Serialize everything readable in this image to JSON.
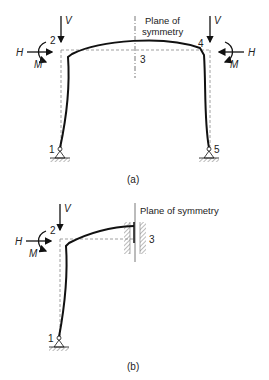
{
  "figure_a": {
    "caption": "(a)",
    "plane_label_line1": "Plane of",
    "plane_label_line2": "symmetry",
    "nodes": [
      "1",
      "2",
      "3",
      "4",
      "5"
    ],
    "left_loads": {
      "vertical": "V",
      "horizontal": "H",
      "moment": "M"
    },
    "right_loads": {
      "vertical": "V",
      "horizontal": "H",
      "moment": "M"
    }
  },
  "figure_b": {
    "caption": "(b)",
    "plane_label": "Plane of symmetry",
    "nodes": [
      "1",
      "2",
      "3"
    ],
    "loads": {
      "vertical": "V",
      "horizontal": "H",
      "moment": "M"
    }
  },
  "colors": {
    "line": "#111111",
    "dashed": "#888888",
    "hatch": "#777777"
  }
}
